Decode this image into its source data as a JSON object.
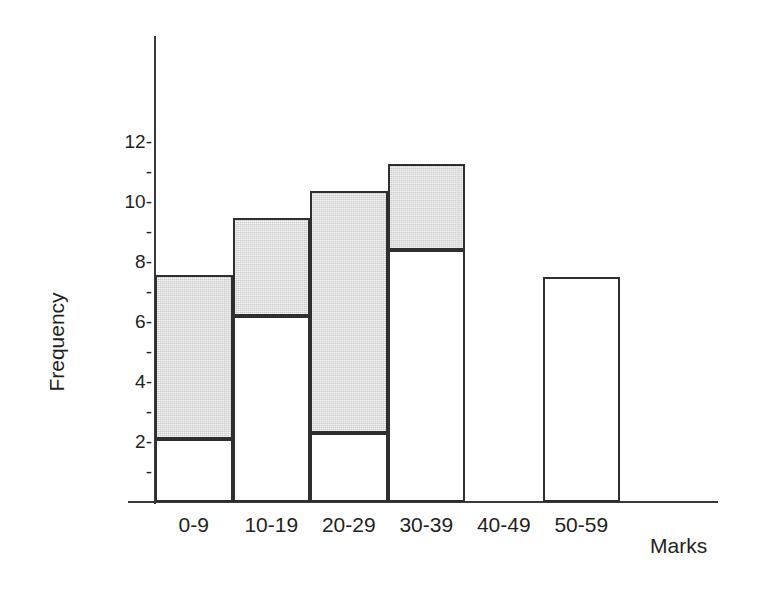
{
  "chart_data": {
    "type": "bar",
    "title": "",
    "xlabel": "Marks",
    "ylabel": "Frequency",
    "categories": [
      "0-9",
      "10-19",
      "20-29",
      "30-39",
      "40-49",
      "50-59"
    ],
    "ylim": [
      0,
      13
    ],
    "y_ticks_major": [
      2,
      4,
      6,
      8,
      10,
      12
    ],
    "y_ticks_minor": [
      1,
      3,
      5,
      7,
      9,
      11
    ],
    "y_tick_labels": [
      "2-",
      "-",
      "4-",
      "-",
      "6-",
      "-",
      "8-",
      "-",
      "10-",
      "-",
      "12-"
    ],
    "grid": false,
    "legend": "none",
    "series": [
      {
        "name": "unshaded-lower",
        "fill": "#ffffff",
        "values": [
          2.1,
          6.2,
          2.3,
          8.4,
          0,
          7.5
        ]
      },
      {
        "name": "shaded-upper",
        "fill": "#c9c9c9",
        "values": [
          5.4,
          3.2,
          8.0,
          2.8,
          0,
          0
        ]
      }
    ],
    "totals": [
      7.5,
      9.4,
      10.3,
      11.2,
      0,
      7.5
    ],
    "bars": [
      {
        "category": "0-9",
        "total": 7.5,
        "lower": 2.1,
        "upper_top": 7.5,
        "has_shading": true
      },
      {
        "category": "10-19",
        "total": 9.4,
        "lower": 6.2,
        "upper_top": 9.4,
        "has_shading": true
      },
      {
        "category": "20-29",
        "total": 10.3,
        "lower": 2.3,
        "upper_top": 10.3,
        "has_shading": true
      },
      {
        "category": "30-39",
        "total": 11.2,
        "lower": 8.4,
        "upper_top": 11.2,
        "has_shading": true
      },
      {
        "category": "40-49",
        "total": 0,
        "lower": 0,
        "upper_top": 0,
        "has_shading": false
      },
      {
        "category": "50-59",
        "total": 7.5,
        "lower": 7.5,
        "upper_top": 7.5,
        "has_shading": false
      }
    ]
  },
  "axis": {
    "y_title": "Frequency",
    "x_title": "Marks"
  },
  "colors": {
    "axis": "#3a3a3a",
    "bar_outline": "#2f2f2f",
    "bar_shaded": "#c9c9c9",
    "bar_unshaded": "#ffffff",
    "text": "#231f20"
  }
}
